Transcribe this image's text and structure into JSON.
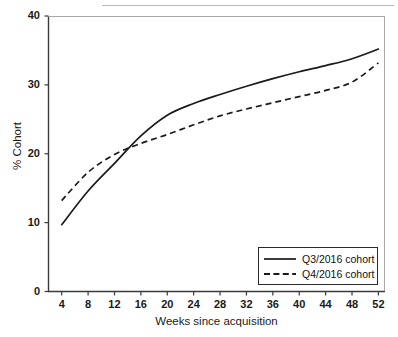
{
  "chart_data": {
    "type": "line",
    "title": "",
    "xlabel": "Weeks since acquisition",
    "ylabel": "% Cohort",
    "xlim": [
      2,
      53
    ],
    "ylim": [
      0,
      40
    ],
    "grid": false,
    "legend_position": "bottom-right",
    "xticks": [
      4,
      8,
      12,
      16,
      20,
      24,
      28,
      32,
      36,
      40,
      44,
      48,
      52
    ],
    "yticks": [
      0,
      10,
      20,
      30,
      40
    ],
    "x": [
      4,
      8,
      12,
      16,
      20,
      24,
      28,
      32,
      36,
      40,
      44,
      48,
      52
    ],
    "series": [
      {
        "name": "Q3/2016 cohort",
        "style": "solid",
        "color": "#1a1a1a",
        "values": [
          9.7,
          14.6,
          18.6,
          22.6,
          25.6,
          27.3,
          28.6,
          29.8,
          30.9,
          31.9,
          32.8,
          33.8,
          35.2
        ]
      },
      {
        "name": "Q4/2016 cohort",
        "style": "dashed",
        "color": "#1a1a1a",
        "values": [
          13.2,
          17.3,
          19.9,
          21.5,
          22.8,
          24.2,
          25.5,
          26.5,
          27.4,
          28.3,
          29.2,
          30.4,
          33.2
        ]
      }
    ]
  },
  "axes": {
    "y_tick_labels": [
      "0",
      "10",
      "20",
      "30",
      "40"
    ],
    "x_tick_labels": [
      "4",
      "8",
      "12",
      "16",
      "20",
      "24",
      "28",
      "32",
      "36",
      "40",
      "44",
      "48",
      "52"
    ],
    "x_title": "Weeks since  acquisition",
    "y_title": "% Cohort"
  },
  "legend": {
    "entries": [
      {
        "label": "Q3/2016 cohort",
        "style": "solid"
      },
      {
        "label": "Q4/2016 cohort",
        "style": "dashed"
      }
    ]
  }
}
